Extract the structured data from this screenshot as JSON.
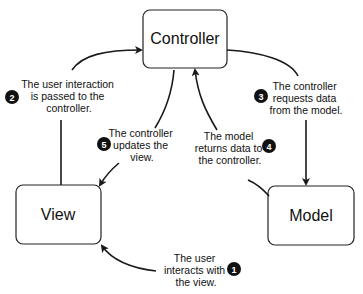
{
  "diagram": {
    "nodes": [
      {
        "id": "controller",
        "label": "Controller"
      },
      {
        "id": "view",
        "label": "View"
      },
      {
        "id": "model",
        "label": "Model"
      }
    ],
    "steps": [
      {
        "number": "1",
        "lines": [
          "The user",
          "interacts with",
          "the view."
        ],
        "from": "user",
        "to": "view"
      },
      {
        "number": "2",
        "lines": [
          "The user interaction",
          "is passed to the",
          "controller."
        ],
        "from": "view",
        "to": "controller"
      },
      {
        "number": "3",
        "lines": [
          "The controller",
          "requests data",
          "from the model."
        ],
        "from": "controller",
        "to": "model"
      },
      {
        "number": "4",
        "lines": [
          "The model",
          "returns data to",
          "the controller."
        ],
        "from": "model",
        "to": "controller"
      },
      {
        "number": "5",
        "lines": [
          "The controller",
          "updates the",
          "view."
        ],
        "from": "controller",
        "to": "view"
      }
    ],
    "colors": {
      "stroke": "#1a1a1a",
      "badge": "#111111",
      "badge_text": "#ffffff",
      "background": "#ffffff"
    }
  }
}
